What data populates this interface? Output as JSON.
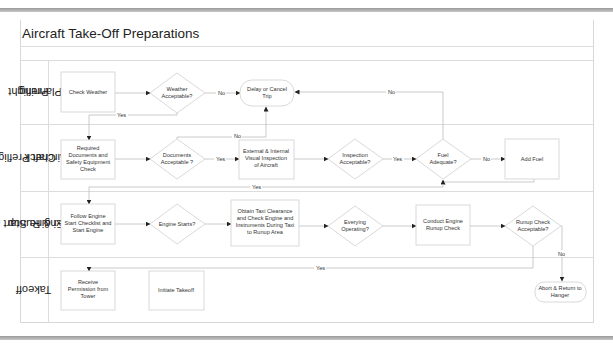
{
  "title": "Aircraft Take-Off Preparations",
  "lanes": [
    {
      "id": "preflight-planning",
      "label_lines": [
        "Preflight",
        "Planning"
      ]
    },
    {
      "id": "aircraft-preflight-check",
      "label_lines": [
        "Aircraft Preflight",
        "Check"
      ]
    },
    {
      "id": "engine-start-taxi-runup",
      "label_lines": [
        "Engine Start &",
        "Taxi & Runup"
      ]
    },
    {
      "id": "takeoff",
      "label_lines": [
        "Takeoff"
      ]
    }
  ],
  "nodes": {
    "check_weather": {
      "type": "process",
      "lines": [
        "Check Weather"
      ]
    },
    "weather_acceptable": {
      "type": "decision",
      "lines": [
        "Weather",
        "Acceptable?"
      ]
    },
    "delay_cancel": {
      "type": "terminator",
      "lines": [
        "Delay or Cancel",
        "Trip"
      ]
    },
    "required_documents": {
      "type": "process",
      "lines": [
        "Required",
        "Documents and",
        "Safety Equipment",
        "Check"
      ]
    },
    "documents_acceptable": {
      "type": "decision",
      "lines": [
        "Documents",
        "Acceptable ?"
      ]
    },
    "external_internal": {
      "type": "process",
      "lines": [
        "External & Internal",
        "Visual Inspection",
        "of Aircraft"
      ]
    },
    "inspection_acceptable": {
      "type": "decision",
      "lines": [
        "Inspection",
        "Acceptable?"
      ]
    },
    "fuel_adequate": {
      "type": "decision",
      "lines": [
        "Fuel",
        "Adequate?"
      ]
    },
    "add_fuel": {
      "type": "process",
      "lines": [
        "Add Fuel"
      ]
    },
    "follow_engine": {
      "type": "process",
      "lines": [
        "Follow Engine",
        "Start Checklist and",
        "Start Engine"
      ]
    },
    "engine_starts": {
      "type": "decision",
      "lines": [
        "Engine Starts?"
      ]
    },
    "obtain_taxi": {
      "type": "process",
      "lines": [
        "Obtain Taxi Clearance",
        "and Check Engine and",
        "Instruments During Taxi",
        "to Runup Area"
      ]
    },
    "everying_operating": {
      "type": "decision",
      "lines": [
        "Everying",
        "Operating?"
      ]
    },
    "conduct_runup": {
      "type": "process",
      "lines": [
        "Conduct Engine",
        "Runup Check"
      ]
    },
    "runup_acceptable": {
      "type": "decision",
      "lines": [
        "Runup Check",
        "Acceptable?"
      ]
    },
    "abort_return": {
      "type": "terminator",
      "lines": [
        "Abort & Return to",
        "Hanger"
      ]
    },
    "receive_permission": {
      "type": "process",
      "lines": [
        "Receive",
        "Permission from",
        "Tower"
      ]
    },
    "initiate_takeoff": {
      "type": "process",
      "lines": [
        "Initiate Takeoff"
      ]
    }
  },
  "edge_labels": {
    "weather_no": "No",
    "weather_yes": "Yes",
    "documents_no": "No",
    "documents_yes": "Yes",
    "inspection_yes": "Yes",
    "fuel_no_delay": "No",
    "fuel_no_add": "No",
    "fuel_yes": "Yes",
    "runup_yes": "Yes",
    "runup_no": "No"
  }
}
